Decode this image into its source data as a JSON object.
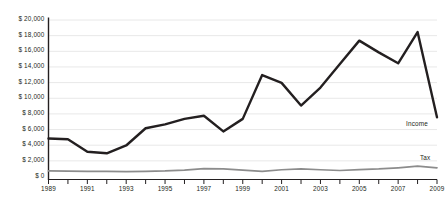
{
  "chart_data": {
    "type": "line",
    "title": "",
    "subtitle": "",
    "xlabel": "",
    "ylabel": "",
    "x": [
      1989,
      1990,
      1991,
      1992,
      1993,
      1994,
      1995,
      1996,
      1997,
      1998,
      1999,
      2000,
      2001,
      2002,
      2003,
      2004,
      2005,
      2006,
      2007,
      2008,
      2009
    ],
    "xlim": [
      1989,
      2009
    ],
    "ylim": [
      0,
      20000
    ],
    "grid": true,
    "grid_axis": "y",
    "legend_position": "inline-right-of-series-end",
    "series": [
      {
        "name": "Income",
        "color": "#231f20",
        "width": 2.4,
        "values": [
          4800,
          4700,
          3100,
          2900,
          3900,
          6100,
          6600,
          7300,
          7700,
          5700,
          7300,
          12900,
          11900,
          9000,
          11300,
          14300,
          17300,
          15800,
          14400,
          18400,
          7500
        ]
      },
      {
        "name": "Tax",
        "color": "#8c8c8c",
        "width": 1.7,
        "values": [
          650,
          620,
          600,
          580,
          560,
          600,
          650,
          760,
          950,
          900,
          760,
          600,
          800,
          900,
          800,
          700,
          820,
          900,
          1050,
          1250,
          1050
        ]
      }
    ],
    "y_ticks": [
      {
        "value": 20000,
        "label": "$ 20,000"
      },
      {
        "value": 18000,
        "label": "$ 18,000"
      },
      {
        "value": 16000,
        "label": "$ 16,000"
      },
      {
        "value": 14000,
        "label": "$ 14,000"
      },
      {
        "value": 12000,
        "label": "$ 12,000"
      },
      {
        "value": 10000,
        "label": "$ 10,000"
      },
      {
        "value": 8000,
        "label": "$ 8,000"
      },
      {
        "value": 6000,
        "label": "$ 6,000"
      },
      {
        "value": 4000,
        "label": "$ 4,000"
      },
      {
        "value": 2000,
        "label": "$ 2,000"
      },
      {
        "value": 0,
        "label": "$ 0"
      }
    ],
    "x_ticks": [
      {
        "value": 1989,
        "label": "1989"
      },
      {
        "value": 1991,
        "label": "1991"
      },
      {
        "value": 1993,
        "label": "1993"
      },
      {
        "value": 1995,
        "label": "1995"
      },
      {
        "value": 1997,
        "label": "1997"
      },
      {
        "value": 1999,
        "label": "1999"
      },
      {
        "value": 2001,
        "label": "2001"
      },
      {
        "value": 2003,
        "label": "2003"
      },
      {
        "value": 2005,
        "label": "2005"
      },
      {
        "value": 2007,
        "label": "2007"
      },
      {
        "value": 2009,
        "label": "2009"
      }
    ],
    "colors": {
      "axis": "#231f20",
      "gridline": "#e8e8e8",
      "text": "#231f20",
      "background": "#ffffff",
      "income_line": "#231f20",
      "tax_line": "#8c8c8c"
    }
  }
}
